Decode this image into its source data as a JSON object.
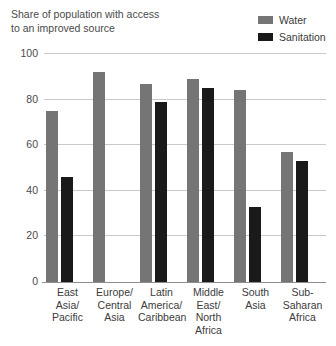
{
  "chart_data": {
    "type": "bar",
    "title": "Share of population with access\nto an improved source",
    "xlabel": "",
    "ylabel": "",
    "ylim": [
      0,
      100
    ],
    "yticks": [
      0,
      20,
      40,
      60,
      80,
      100
    ],
    "ytick_labels": [
      "0",
      "20",
      "40",
      "60",
      "80",
      "100"
    ],
    "grid": true,
    "legend_position": "top-right",
    "categories": [
      "East\nAsia/\nPacific",
      "Europe/\nCentral\nAsia",
      "Latin\nAmerica/\nCaribbean",
      "Middle\nEast/\nNorth\nAfrica",
      "South\nAsia",
      "Sub-\nSaharan\nAfrica"
    ],
    "series": [
      {
        "name": "Water",
        "color": "#757575",
        "values": [
          75,
          92,
          87,
          89,
          84,
          57
        ]
      },
      {
        "name": "Sanitation",
        "color": "#1a1a1a",
        "values": [
          46,
          null,
          79,
          85,
          33,
          53
        ]
      }
    ]
  },
  "legend": {
    "items": [
      {
        "label": "Water",
        "color": "#757575"
      },
      {
        "label": "Sanitation",
        "color": "#1a1a1a"
      }
    ]
  },
  "colors": {
    "water": "#757575",
    "sanitation": "#1a1a1a",
    "gridline": "#c9c9c9",
    "axis": "#8e8e8e",
    "text": "#3b3b3b",
    "background": "#ffffff"
  }
}
